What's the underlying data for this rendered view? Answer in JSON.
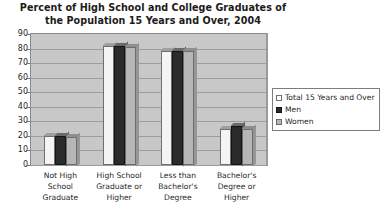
{
  "chart_data": {
    "type": "bar",
    "title": "Percent of High School and College Graduates of the Population 15 Years and Over, 2004",
    "title_line1": "Percent of High School and College Graduates of",
    "title_line2": "the Population 15 Years and Over, 2004",
    "xlabel": "",
    "ylabel": "",
    "ylim": [
      0,
      90
    ],
    "ytick_step": 10,
    "yticks": [
      90,
      80,
      70,
      60,
      50,
      40,
      30,
      20,
      10,
      0
    ],
    "grid": true,
    "legend_position": "right",
    "categories": [
      "Not High School Graduate",
      "High School Graduate or Higher",
      "Less than Bachelor's Degree",
      "Bachelor's Degree or Higher"
    ],
    "category_lines": [
      [
        "Not High",
        "School",
        "Graduate"
      ],
      [
        "High School",
        "Graduate or",
        "Higher"
      ],
      [
        "Less than",
        "Bachelor's",
        "Degree"
      ],
      [
        "Bachelor's",
        "Degree or",
        "Higher"
      ]
    ],
    "series": [
      {
        "name": "Total 15 Years and Over",
        "key": "total",
        "color": "#f4f4f2",
        "values": [
          20,
          82,
          78,
          25
        ]
      },
      {
        "name": "Men",
        "key": "men",
        "color": "#2b2b2b",
        "values": [
          20,
          82,
          78,
          27
        ]
      },
      {
        "name": "Women",
        "key": "women",
        "color": "#b6b6b6",
        "values": [
          19,
          81,
          78,
          25
        ]
      }
    ]
  },
  "legend": {
    "items": [
      {
        "label": "Total 15 Years and Over",
        "swatch": "total"
      },
      {
        "label": "Men",
        "swatch": "men"
      },
      {
        "label": "Women",
        "swatch": "women"
      }
    ]
  },
  "axis": {
    "y_labels": [
      "90",
      "80",
      "70",
      "60",
      "50",
      "40",
      "30",
      "20",
      "10",
      "0"
    ]
  },
  "colors": {
    "plot_background": "#c8c8c8",
    "gridline": "#9d9d9d",
    "frame": "#8a8a8a",
    "text": "#1f1f1f",
    "total": "#f4f4f2",
    "men": "#2b2b2b",
    "women": "#b6b6b6"
  }
}
